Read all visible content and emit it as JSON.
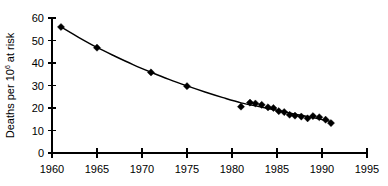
{
  "chart_data": {
    "type": "scatter",
    "title": "",
    "xlabel": "",
    "ylabel": "Deaths per 10",
    "ylabel_superscript": "6",
    "ylabel_suffix": " at risk",
    "xlim": [
      1960,
      1995
    ],
    "ylim": [
      0,
      60
    ],
    "xticks": [
      1960,
      1965,
      1970,
      1975,
      1980,
      1985,
      1990,
      1995
    ],
    "yticks": [
      0,
      10,
      20,
      30,
      40,
      50,
      60
    ],
    "xtick_labels": [
      "1960",
      "1965",
      "1970",
      "1975",
      "1980",
      "1985",
      "1990",
      "1995"
    ],
    "ytick_labels": [
      "0",
      "10",
      "20",
      "30",
      "40",
      "50",
      "60"
    ],
    "grid": false,
    "legend": "none",
    "marker": "filled-diamond",
    "series": [
      {
        "name": "Deaths per million at risk",
        "x": [
          1961,
          1965,
          1971,
          1975,
          1981,
          1982,
          1982.6,
          1983.3,
          1984,
          1984.6,
          1985.2,
          1985.8,
          1986.4,
          1987,
          1987.7,
          1988.4,
          1989,
          1989.7,
          1990.4,
          1991
        ],
        "values": [
          56.0,
          46.8,
          35.8,
          29.7,
          20.6,
          22.4,
          22.0,
          21.4,
          20.3,
          20.0,
          18.6,
          18.2,
          17.0,
          16.6,
          16.2,
          15.4,
          16.4,
          15.9,
          14.8,
          13.3
        ]
      }
    ],
    "fitted_curve": {
      "description": "smooth monotonically decreasing fitted line through all points",
      "x": [
        1961,
        1963,
        1965,
        1967,
        1969,
        1971,
        1973,
        1975,
        1977,
        1979,
        1981,
        1983,
        1985,
        1987,
        1989,
        1991
      ],
      "y": [
        56.0,
        51.3,
        46.9,
        43.0,
        39.3,
        35.9,
        32.7,
        29.8,
        27.1,
        24.6,
        22.3,
        20.6,
        19.0,
        17.3,
        15.7,
        14.0
      ]
    }
  },
  "colors": {
    "axis": "#000000",
    "marker": "#000000",
    "curve": "#000000",
    "background": "#ffffff"
  }
}
